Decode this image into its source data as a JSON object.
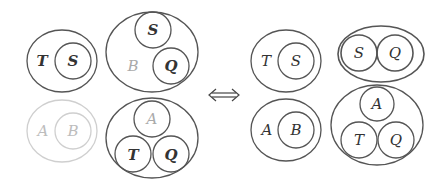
{
  "colors": {
    "stroke": "#555555",
    "stroke_faded": "#cfcfcf",
    "text": "#333333",
    "text_faded_b": "#aaaaaa",
    "text_faded_ab": "#bdbdbd"
  },
  "left_side": {
    "group_ts": {
      "outer_label": "T",
      "inner_label": "S"
    },
    "group_bsq": {
      "outer_label": "B",
      "inner_labels": [
        "S",
        "Q"
      ]
    },
    "group_ab": {
      "outer_label": "A",
      "inner_label": "B",
      "faded": true
    },
    "group_atq": {
      "inner_labels": [
        "A",
        "T",
        "Q"
      ]
    }
  },
  "equivalence_symbol": "⟺",
  "right_side": {
    "group_ts": {
      "outer_label": "T",
      "inner_label": "S"
    },
    "group_sq": {
      "inner_labels": [
        "S",
        "Q"
      ]
    },
    "group_ab": {
      "outer_label": "A",
      "inner_label": "B"
    },
    "group_atq": {
      "inner_labels": [
        "A",
        "T",
        "Q"
      ]
    }
  }
}
